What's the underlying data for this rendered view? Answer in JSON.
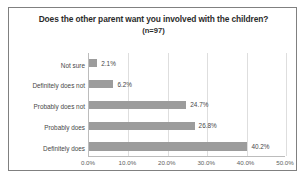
{
  "chart_data": {
    "type": "bar",
    "orientation": "horizontal",
    "title": "Does the other parent want you involved with the children?",
    "subtitle": "(n=97)",
    "xlabel": "",
    "ylabel": "",
    "categories": [
      "Not sure",
      "Definitely does not",
      "Probably does not",
      "Probably does",
      "Definitely does"
    ],
    "values": [
      2.1,
      6.2,
      24.7,
      26.8,
      40.2
    ],
    "value_labels": [
      "2.1%",
      "6.2%",
      "24.7%",
      "26.8%",
      "40.2%"
    ],
    "xlim": [
      0,
      50
    ],
    "xticks": [
      0,
      10,
      20,
      30,
      40,
      50
    ],
    "xtick_labels": [
      "0.0%",
      "10.0%",
      "20.0%",
      "30.0%",
      "40.0%",
      "50.0%"
    ],
    "grid": "vertical",
    "legend": "none",
    "bar_color": "#969696",
    "gridline_color": "#dcdcdc",
    "axis_color": "#b8b8b8",
    "text_color": "#3a3a3a",
    "title_color": "#1a1a1a",
    "frame_color": "#808080",
    "background": "#ffffff"
  }
}
